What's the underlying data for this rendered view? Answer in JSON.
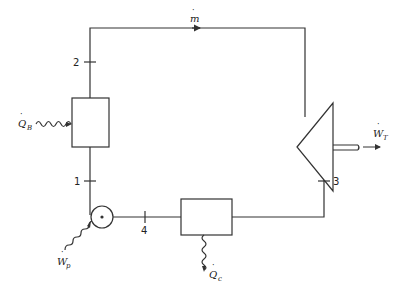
{
  "diagram": {
    "type": "Rankine cycle schematic",
    "components": [
      {
        "id": "boiler",
        "label": "Q̇_B",
        "label_main": "Q",
        "label_sub": "B",
        "role": "heat-input"
      },
      {
        "id": "turbine",
        "label": "Ẇ_T",
        "label_main": "W",
        "label_sub": "T",
        "role": "work-output"
      },
      {
        "id": "condenser",
        "label": "Q̇_c",
        "label_main": "Q",
        "label_sub": "c",
        "role": "heat-rejection"
      },
      {
        "id": "pump",
        "label": "Ẇ_p",
        "label_main": "W",
        "label_sub": "p",
        "role": "work-input"
      }
    ],
    "states": [
      {
        "id": "1",
        "label": "1"
      },
      {
        "id": "2",
        "label": "2"
      },
      {
        "id": "3",
        "label": "3"
      },
      {
        "id": "4",
        "label": "4"
      }
    ],
    "mass_flow": {
      "label": "ṁ",
      "label_main": "m"
    },
    "colors": {
      "line": "#333333",
      "background": "#ffffff"
    }
  }
}
